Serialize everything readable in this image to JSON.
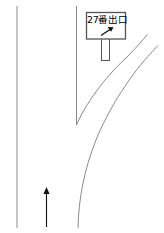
{
  "diagram": {
    "type": "road-exit-signage-schematic",
    "title": "",
    "background_color": "#ffffff",
    "line_color": "#7a7a7a",
    "sign_border_color": "#555555",
    "sign_fill_color": "#ffffff",
    "arrow_color": "#1a1a1a",
    "text_color": "#000000"
  },
  "sign": {
    "label": "27番出口",
    "arrow_icon": "arrow-up-right-icon",
    "post_label": "sign-post"
  },
  "roadway": {
    "left_edge_label": "left-road-edge",
    "center_edge_label": "center-road-edge",
    "ramp_outer_label": "ramp-outer-curve",
    "ramp_inner_label": "ramp-inner-curve"
  },
  "direction_marker": {
    "label": "travel-direction-arrow",
    "icon": "arrow-up-icon"
  }
}
